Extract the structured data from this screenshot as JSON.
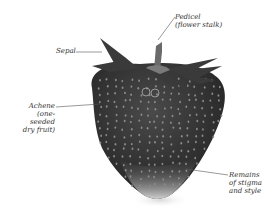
{
  "diagram": {
    "labels": {
      "pedicel": [
        "Pedicel",
        "(flower stalk)"
      ],
      "sepal": [
        "Sepal"
      ],
      "achene": [
        "Achene",
        "(one-seeded",
        "dry fruit)"
      ],
      "remains": [
        "Remains",
        "of stigma",
        "and style"
      ]
    },
    "colors": {
      "fruit_dark": "#2e2e2e",
      "fruit_mid": "#4a4a4a",
      "fruit_tip": "#bdbdbd",
      "sepal": "#3a3a3a",
      "stalk": "#6a6a6a",
      "leader_line": "#555555",
      "seed": "#8a8a8a"
    }
  }
}
